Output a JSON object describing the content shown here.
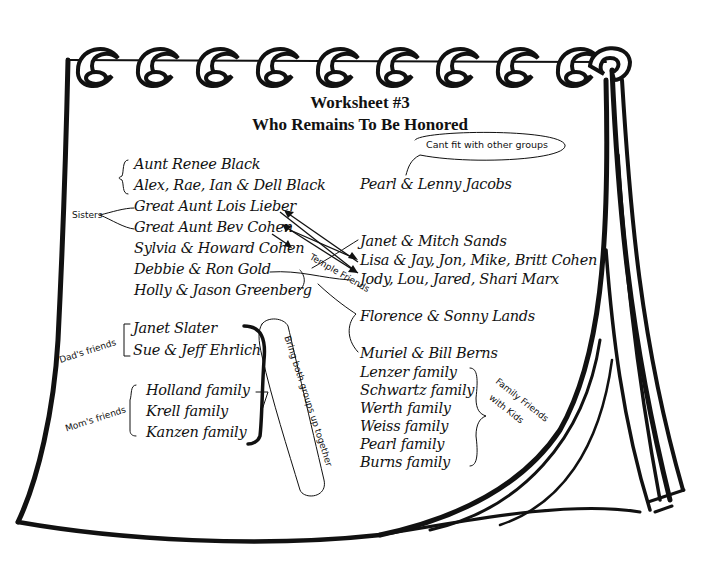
{
  "worksheet": {
    "title": "Worksheet #3",
    "subtitle": "Who Remains To Be Honored"
  },
  "left_column": {
    "black_family": [
      "Aunt Renee Black",
      "Alex, Rae, Ian & Dell Black"
    ],
    "sisters_label": "Sisters",
    "sisters": [
      "Great Aunt Lois Lieber",
      "Great Aunt Bev Cohen"
    ],
    "others": [
      "Sylvia & Howard Cohen",
      "Debbie & Ron Gold",
      "Holly & Jason Greenberg"
    ]
  },
  "dads_friends": {
    "label": "Dad's friends",
    "names": [
      "Janet Slater",
      "Sue & Jeff Ehrlich"
    ]
  },
  "moms_friends": {
    "label": "Mom's friends",
    "names": [
      "Holland family",
      "Krell family",
      "Kanzen family"
    ]
  },
  "bring_together_note": "Bring both groups up together",
  "cant_fit_note": "Cant fit with other groups",
  "pearl_lenny": "Pearl & Lenny Jacobs",
  "right_column": {
    "names": [
      "Janet & Mitch Sands",
      "Lisa & Jay, Jon, Mike, Britt Cohen",
      "Jody, Lou, Jared, Shari Marx"
    ]
  },
  "temple_friends": {
    "label": "Temple Friends",
    "names": [
      "Florence & Sonny Lands",
      "Muriel & Bill Berns"
    ]
  },
  "family_friends_with_kids": {
    "label_line1": "Family Friends",
    "label_line2": "with Kids",
    "names": [
      "Lenzer family",
      "Schwartz family",
      "Werth family",
      "Weiss family",
      "Pearl family",
      "Burns family"
    ]
  },
  "colors": {
    "ink": "#111111",
    "paper": "#ffffff"
  }
}
